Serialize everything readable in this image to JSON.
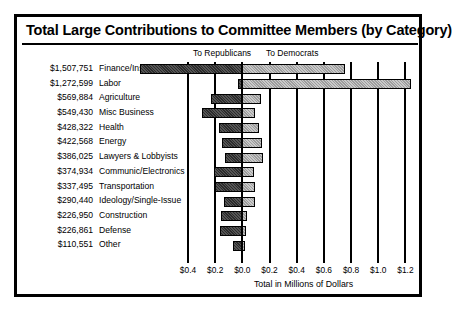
{
  "chart_data": {
    "type": "bar",
    "orientation": "horizontal-diverging",
    "title": "Total Large Contributions to Committee Members (by Category)",
    "xlabel": "Total in Millions of Dollars",
    "ylabel": "",
    "xlim": [
      -0.4,
      1.3
    ],
    "grid": true,
    "legend_position": "top",
    "legend": [
      {
        "name": "To Republicans",
        "color": "#2b2b2b",
        "direction": "left"
      },
      {
        "name": "To Democrats",
        "color": "#c9c9c9",
        "direction": "right"
      }
    ],
    "tick_values": [
      -0.4,
      -0.2,
      0.0,
      0.2,
      0.4,
      0.6,
      0.8,
      1.0,
      1.2
    ],
    "tick_labels": [
      "$0.4",
      "$0.2",
      "$0.0",
      "$0.2",
      "$0.4",
      "$0.6",
      "$0.8",
      "$1.0",
      "$1.2"
    ],
    "categories": [
      "Finance/Insur/Real Est",
      "Labor",
      "Agriculture",
      "Misc Business",
      "Health",
      "Energy",
      "Lawyers & Lobbyists",
      "Communic/Electronics",
      "Transportation",
      "Ideology/Single-Issue",
      "Construction",
      "Defense",
      "Other"
    ],
    "totals": [
      "$1,507,751",
      "$1,272,599",
      "$569,884",
      "$549,430",
      "$428,322",
      "$422,568",
      "$386,025",
      "$374,934",
      "$337,495",
      "$290,440",
      "$226,950",
      "$226,861",
      "$110,551"
    ],
    "series": [
      {
        "name": "To Republicans",
        "values": [
          -0.755,
          -0.035,
          -0.23,
          -0.3,
          -0.175,
          -0.15,
          -0.13,
          -0.205,
          -0.2,
          -0.135,
          -0.16,
          -0.165,
          -0.07
        ]
      },
      {
        "name": "To Democrats",
        "values": [
          0.753,
          1.238,
          0.14,
          0.09,
          0.12,
          0.145,
          0.15,
          0.085,
          0.09,
          0.09,
          0.033,
          0.028,
          0.02
        ]
      }
    ]
  },
  "rows": [
    {
      "total": "$1,507,751",
      "category": "Finance/Insur/Real Est",
      "rep": -0.755,
      "dem": 0.753
    },
    {
      "total": "$1,272,599",
      "category": "Labor",
      "rep": -0.035,
      "dem": 1.238
    },
    {
      "total": "$569,884",
      "category": "Agriculture",
      "rep": -0.23,
      "dem": 0.14
    },
    {
      "total": "$549,430",
      "category": "Misc Business",
      "rep": -0.3,
      "dem": 0.09
    },
    {
      "total": "$428,322",
      "category": "Health",
      "rep": -0.175,
      "dem": 0.12
    },
    {
      "total": "$422,568",
      "category": "Energy",
      "rep": -0.15,
      "dem": 0.145
    },
    {
      "total": "$386,025",
      "category": "Lawyers & Lobbyists",
      "rep": -0.13,
      "dem": 0.15
    },
    {
      "total": "$374,934",
      "category": "Communic/Electronics",
      "rep": -0.205,
      "dem": 0.085
    },
    {
      "total": "$337,495",
      "category": "Transportation",
      "rep": -0.2,
      "dem": 0.09
    },
    {
      "total": "$290,440",
      "category": "Ideology/Single-Issue",
      "rep": -0.135,
      "dem": 0.09
    },
    {
      "total": "$226,950",
      "category": "Construction",
      "rep": -0.16,
      "dem": 0.033
    },
    {
      "total": "$226,861",
      "category": "Defense",
      "rep": -0.165,
      "dem": 0.028
    },
    {
      "total": "$110,551",
      "category": "Other",
      "rep": -0.07,
      "dem": 0.02
    }
  ],
  "legend": {
    "republicans": "To Republicans",
    "democrats": "To Democrats"
  },
  "axis": {
    "title": "Total in Millions of Dollars"
  },
  "colors": {
    "republican_fill": "#2b2b2b",
    "democrat_fill": "#c9c9c9",
    "frame": "#000000",
    "background": "#ffffff"
  }
}
